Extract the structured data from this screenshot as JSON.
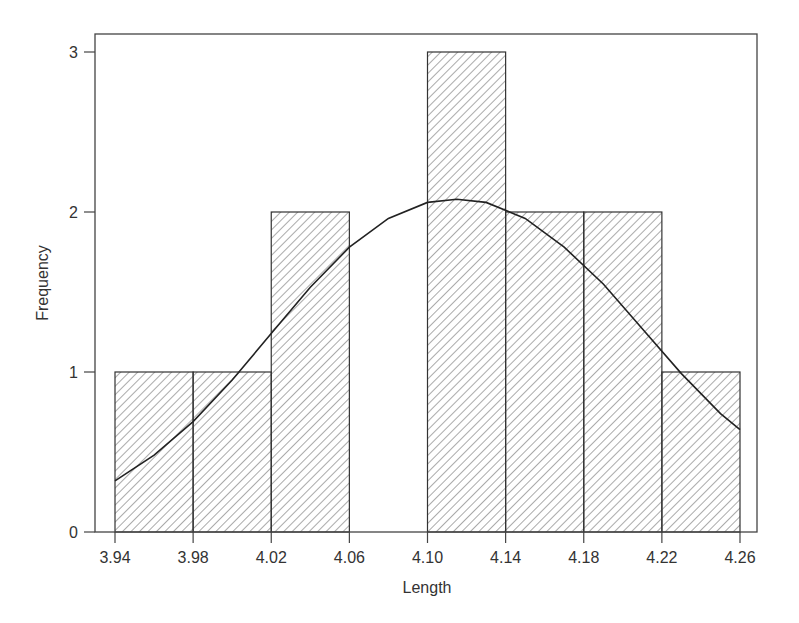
{
  "chart_data": {
    "type": "bar",
    "subtype": "histogram",
    "title": "",
    "xlabel": "Length",
    "ylabel": "Frequency",
    "bins": [
      {
        "start": 3.94,
        "end": 3.98,
        "count": 1
      },
      {
        "start": 3.98,
        "end": 4.02,
        "count": 1
      },
      {
        "start": 4.02,
        "end": 4.06,
        "count": 2
      },
      {
        "start": 4.06,
        "end": 4.1,
        "count": 0
      },
      {
        "start": 4.1,
        "end": 4.14,
        "count": 3
      },
      {
        "start": 4.14,
        "end": 4.18,
        "count": 2
      },
      {
        "start": 4.18,
        "end": 4.22,
        "count": 2
      },
      {
        "start": 4.22,
        "end": 4.26,
        "count": 1
      }
    ],
    "categories": [
      "3.94-3.98",
      "3.98-4.02",
      "4.02-4.06",
      "4.06-4.10",
      "4.10-4.14",
      "4.14-4.18",
      "4.18-4.22",
      "4.22-4.26"
    ],
    "values": [
      1,
      1,
      2,
      0,
      3,
      2,
      2,
      1
    ],
    "x_ticks": [
      "3.94",
      "3.98",
      "4.02",
      "4.06",
      "4.10",
      "4.14",
      "4.18",
      "4.22",
      "4.26"
    ],
    "y_ticks": [
      "0",
      "1",
      "2",
      "3"
    ],
    "xlim": [
      3.93,
      4.27
    ],
    "ylim": [
      0,
      3.11
    ],
    "grid": false,
    "legend": null,
    "fill_pattern": "diagonal-hatch",
    "overlay": {
      "type": "normal-curve",
      "points": [
        [
          3.94,
          0.32
        ],
        [
          3.96,
          0.48
        ],
        [
          3.98,
          0.69
        ],
        [
          4.0,
          0.95
        ],
        [
          4.02,
          1.24
        ],
        [
          4.04,
          1.53
        ],
        [
          4.06,
          1.78
        ],
        [
          4.08,
          1.96
        ],
        [
          4.1,
          2.06
        ],
        [
          4.115,
          2.08
        ],
        [
          4.13,
          2.06
        ],
        [
          4.15,
          1.96
        ],
        [
          4.17,
          1.78
        ],
        [
          4.19,
          1.55
        ],
        [
          4.21,
          1.27
        ],
        [
          4.23,
          0.99
        ],
        [
          4.25,
          0.74
        ],
        [
          4.26,
          0.64
        ]
      ]
    }
  }
}
